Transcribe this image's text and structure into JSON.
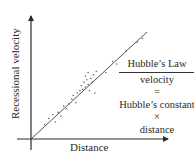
{
  "chart_data": {
    "type": "scatter",
    "xlabel": "Distance",
    "ylabel": "Recessional velocity",
    "grid": false,
    "axis_ticks": false,
    "xlim": [
      0,
      1
    ],
    "ylim": [
      0,
      1
    ],
    "fit_line": {
      "x": [
        0,
        0.85
      ],
      "y": [
        0,
        0.88
      ],
      "slope": 1.03
    },
    "points": [
      {
        "x": 0.1,
        "y": 0.12
      },
      {
        "x": 0.13,
        "y": 0.17
      },
      {
        "x": 0.16,
        "y": 0.2
      },
      {
        "x": 0.18,
        "y": 0.14
      },
      {
        "x": 0.2,
        "y": 0.22
      },
      {
        "x": 0.22,
        "y": 0.19
      },
      {
        "x": 0.24,
        "y": 0.27
      },
      {
        "x": 0.26,
        "y": 0.25
      },
      {
        "x": 0.28,
        "y": 0.29
      },
      {
        "x": 0.3,
        "y": 0.33
      },
      {
        "x": 0.31,
        "y": 0.36
      },
      {
        "x": 0.33,
        "y": 0.3
      },
      {
        "x": 0.34,
        "y": 0.38
      },
      {
        "x": 0.36,
        "y": 0.4
      },
      {
        "x": 0.37,
        "y": 0.44
      },
      {
        "x": 0.38,
        "y": 0.41
      },
      {
        "x": 0.39,
        "y": 0.47
      },
      {
        "x": 0.4,
        "y": 0.43
      },
      {
        "x": 0.4,
        "y": 0.52
      },
      {
        "x": 0.41,
        "y": 0.49
      },
      {
        "x": 0.42,
        "y": 0.45
      },
      {
        "x": 0.42,
        "y": 0.55
      },
      {
        "x": 0.43,
        "y": 0.4
      },
      {
        "x": 0.44,
        "y": 0.5
      },
      {
        "x": 0.45,
        "y": 0.47
      },
      {
        "x": 0.46,
        "y": 0.53
      },
      {
        "x": 0.47,
        "y": 0.38
      },
      {
        "x": 0.48,
        "y": 0.56
      },
      {
        "x": 0.55,
        "y": 0.55
      },
      {
        "x": 0.6,
        "y": 0.64
      },
      {
        "x": 0.63,
        "y": 0.62
      },
      {
        "x": 0.7,
        "y": 0.73
      },
      {
        "x": 0.78,
        "y": 0.8
      },
      {
        "x": 0.82,
        "y": 0.83
      }
    ],
    "annotations": [
      "Hubble's Law",
      "velocity",
      "=",
      "Hubble's constant",
      "×",
      "distance"
    ]
  },
  "equation": {
    "title": "Hubble’s Law",
    "line1": "velocity",
    "equals": "=",
    "line2": "Hubble’s constant",
    "times": "×",
    "line3": "distance"
  },
  "axes": {
    "x_label": "Distance",
    "y_label": "Recessional velocity"
  },
  "colors": {
    "axis": "#2a2a2a",
    "line": "#555555",
    "points": "#666666"
  }
}
